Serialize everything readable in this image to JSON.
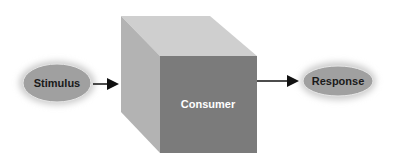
{
  "diagram": {
    "nodes": {
      "stimulus": {
        "label": "Stimulus"
      },
      "consumer": {
        "label": "Consumer"
      },
      "response": {
        "label": "Response"
      }
    },
    "edges": [
      {
        "from": "stimulus",
        "to": "consumer"
      },
      {
        "from": "consumer",
        "to": "response"
      }
    ],
    "colors": {
      "ellipse_fill": "#9a9a9a",
      "cube_front": "#7a7a7a",
      "cube_top": "#c9c9c9",
      "cube_side": "#b5b5b5",
      "arrow": "#111111",
      "consumer_text": "#ffffff",
      "ellipse_text": "#1a1a1a"
    }
  }
}
